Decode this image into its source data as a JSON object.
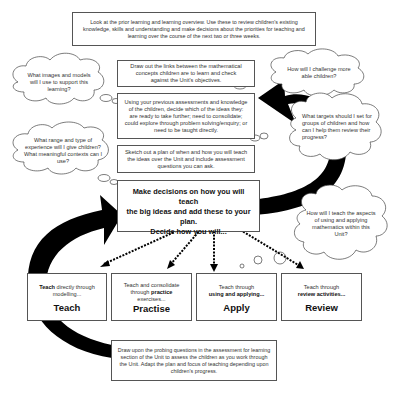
{
  "boxes": {
    "prior_learning": "Look at the prior learning and learning overview. Use these to review children's existing knowledge, skills and understanding and make decisions about the priorities for teaching and learning over the course of the next two or three weeks.",
    "links": "Draw out the links between the mathematical concepts children are to learn and check against the Unit's objectives.",
    "assessments": "Using your previous assessments and knowledge of the children, decide which of the ideas they: are ready to take further; need to consolidate; could explore through problem solving/enquiry; or need to be taught directly.",
    "sketch": "Sketch out a plan of when and how you will teach the ideas over the Unit and include assessment questions you can ask.",
    "decisions_line1": "Make decisions on how you will teach",
    "decisions_line2": "the big ideas and add these to your plan.",
    "decisions_line3": "Decide how you will...",
    "probing": "Draw upon the probing questions in the assessment for learning section of the Unit to assess the children as you work through the Unit. Adapt the plan and focus of teaching depending upon children's progress."
  },
  "clouds": {
    "images_models": "What images and models will I use to support this learning?",
    "range_experience": "What range and type of experience will I give children? What meaningful contexts can I use?",
    "challenge": "How will I challenge more able children?",
    "targets": "What targets should I set for groups of children and how can I help them review their progress?",
    "using_applying": "How will I teach the aspects of using and applying mathematics within this Unit?"
  },
  "stages": [
    {
      "pre": "",
      "bold": "Teach",
      "post": " directly through modelling...",
      "title": "Teach"
    },
    {
      "pre": "Teach and consolidate through ",
      "bold": "practice",
      "post": " exercises...",
      "title": "Practise"
    },
    {
      "pre": "Teach through ",
      "bold": "using and applying...",
      "post": "",
      "title": "Apply"
    },
    {
      "pre": "Teach through ",
      "bold": "review activities...",
      "post": "",
      "title": "Review"
    }
  ],
  "colors": {
    "arrow": "#000000",
    "border": "#555555",
    "text": "#333333"
  }
}
